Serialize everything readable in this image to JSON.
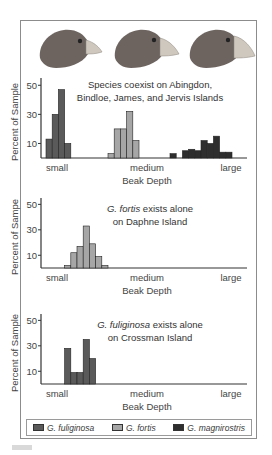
{
  "colors": {
    "G. fuliginosa": "#5a5a5a",
    "G. fortis": "#a6a6a6",
    "G. magnirostris": "#2e2e2e",
    "axis": "#3a3a3a",
    "bird_body": "#6d6460",
    "bird_beak": "#c9c2b8"
  },
  "legend": {
    "items": [
      {
        "label": "G. fuliginosa",
        "color": "#5a5a5a"
      },
      {
        "label": "G. fortis",
        "color": "#a6a6a6"
      },
      {
        "label": "G. magnirostris",
        "color": "#2e2e2e"
      }
    ]
  },
  "birds": [
    "small-beak-finch",
    "medium-beak-finch",
    "large-beak-finch"
  ],
  "chart_data": [
    {
      "type": "bar",
      "title_lines": [
        "Species coexist on Abingdon,",
        "Bindloe, James, and Jervis Islands"
      ],
      "title_italic_prefix": "",
      "xlabel": "Beak Depth",
      "ylabel": "Percent of Sample",
      "x_tick_labels": [
        "small",
        "medium",
        "large"
      ],
      "y_ticks": [
        10,
        30,
        50
      ],
      "ylim": [
        0,
        55
      ],
      "grid": false,
      "series": [
        {
          "name": "G. fuliginosa",
          "start_bin": 0,
          "values": [
            13,
            30,
            47,
            10
          ]
        },
        {
          "name": "G. fortis",
          "start_bin": 10,
          "values": [
            3,
            20,
            20,
            32,
            12
          ]
        },
        {
          "name": "G. magnirostris",
          "start_bin": 20,
          "values": [
            3,
            0,
            5,
            6,
            5,
            12,
            10,
            15,
            4,
            4
          ]
        }
      ]
    },
    {
      "type": "bar",
      "title_lines": [
        "G. fortis exists alone",
        "on Daphne Island"
      ],
      "title_italic_prefix": "G. fortis",
      "xlabel": "Beak Depth",
      "ylabel": "Percent of Sampe",
      "x_tick_labels": [
        "small",
        "medium",
        "large"
      ],
      "y_ticks": [
        10,
        30,
        50
      ],
      "ylim": [
        0,
        55
      ],
      "grid": false,
      "series": [
        {
          "name": "G. fortis",
          "start_bin": 3,
          "values": [
            2,
            12,
            17,
            33,
            19,
            9,
            2
          ]
        }
      ]
    },
    {
      "type": "bar",
      "title_lines": [
        "G. fuliginosa exists alone",
        "on Crossman Island"
      ],
      "title_italic_prefix": "G. fuliginosa",
      "xlabel": "Beak Depth",
      "ylabel": "Percent of Sample",
      "x_tick_labels": [
        "small",
        "medium",
        "large"
      ],
      "y_ticks": [
        10,
        30,
        50
      ],
      "ylim": [
        0,
        55
      ],
      "grid": false,
      "series": [
        {
          "name": "G. fuliginosa",
          "start_bin": 3,
          "values": [
            28,
            9,
            9,
            35,
            20
          ]
        }
      ]
    }
  ]
}
